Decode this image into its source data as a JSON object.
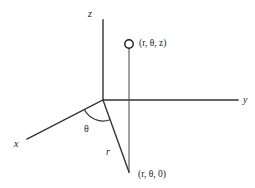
{
  "figure": {
    "background_color": "#ffffff",
    "line_color": "#333333",
    "text_color": "#1b1b1b",
    "axes": [
      {
        "name": "z",
        "label": "z",
        "from": [
          103,
          100
        ],
        "to": [
          103,
          20
        ],
        "label_pos": [
          88,
          10
        ]
      },
      {
        "name": "y",
        "label": "y",
        "from": [
          103,
          100
        ],
        "to": [
          238,
          100
        ],
        "label_pos": [
          243,
          95
        ]
      },
      {
        "name": "x",
        "label": "x",
        "from": [
          103,
          100
        ],
        "to": [
          27,
          139
        ],
        "label_pos": [
          14,
          139
        ]
      }
    ],
    "labels": {
      "z_axis": "z",
      "y_axis": "y",
      "x_axis": "x",
      "theta": "θ",
      "radius": "r",
      "point_upper": "(r, θ, z)",
      "point_lower": "(r, θ, 0)"
    },
    "point_marker": {
      "name": "point-r-theta-z",
      "shape": "circle",
      "cx": 129,
      "cy": 44,
      "r": 4.2
    },
    "segments": [
      {
        "name": "vertical-drop-line",
        "from": [
          129,
          49
        ],
        "to": [
          129,
          172
        ]
      },
      {
        "name": "radius-line",
        "from": [
          103,
          100
        ],
        "to": [
          129,
          172
        ]
      }
    ],
    "angle_arc": {
      "name": "theta-arc",
      "center": [
        103,
        100
      ],
      "radius": 21,
      "start_deg": 152.8,
      "end_deg": 70.2
    },
    "label_positions": {
      "theta": [
        84,
        125
      ],
      "radius": [
        106,
        147
      ],
      "point_upper": [
        139,
        38
      ],
      "point_lower": [
        138,
        169
      ]
    }
  }
}
